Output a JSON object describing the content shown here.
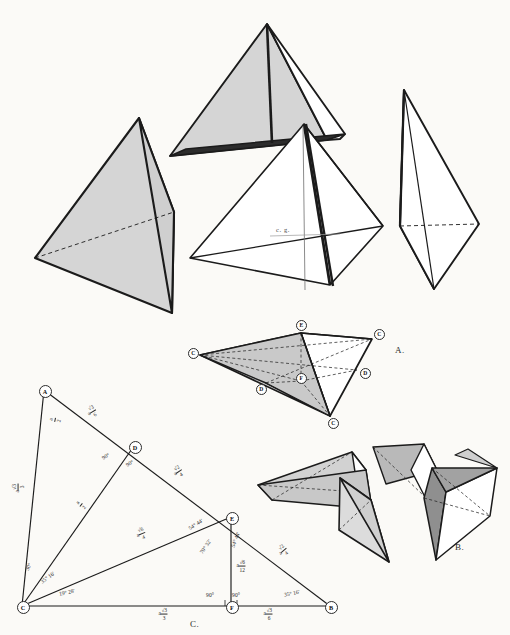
{
  "plate": {
    "title": "Geometric plate: regular tetrahedron dissection and characteristic triangle",
    "background": "#fbfaf7",
    "ink": "#1b1b1b",
    "fill_light": "#d8d8d8",
    "fill_mid": "#b5b5b5",
    "fill_dark": "#3a3a3a"
  },
  "figure_labels": {
    "a": "A.",
    "b": "B.",
    "c": "C."
  },
  "annotations": {
    "center_of_gravity": "c. g."
  },
  "figure_a_nodes": [
    {
      "id": "E",
      "label": "E",
      "x": 301,
      "y": 325
    },
    {
      "id": "C1",
      "label": "C",
      "x": 193,
      "y": 353
    },
    {
      "id": "C2",
      "label": "C",
      "x": 379,
      "y": 334
    },
    {
      "id": "C3",
      "label": "C",
      "x": 333,
      "y": 423
    },
    {
      "id": "D1",
      "label": "D",
      "x": 261,
      "y": 389
    },
    {
      "id": "D2",
      "label": "D",
      "x": 365,
      "y": 373
    },
    {
      "id": "F",
      "label": "F",
      "x": 301,
      "y": 378
    }
  ],
  "triangle_c": {
    "vertices": [
      {
        "id": "A",
        "label": "A",
        "x": 44,
        "y": 390
      },
      {
        "id": "D",
        "label": "D",
        "x": 134,
        "y": 446
      },
      {
        "id": "E",
        "label": "E",
        "x": 231,
        "y": 517
      },
      {
        "id": "B",
        "label": "B",
        "x": 330,
        "y": 606
      },
      {
        "id": "C",
        "label": "C",
        "x": 22,
        "y": 606
      },
      {
        "id": "F",
        "label": "F",
        "x": 231,
        "y": 606
      }
    ],
    "segment_labels": [
      {
        "name": "AD-upper",
        "pre": "a",
        "num": "√3",
        "den": "6",
        "x": 92,
        "y": 412,
        "rot": -31
      },
      {
        "name": "A-left-a2",
        "pre": "",
        "num": "a",
        "den": "2",
        "x": 55,
        "y": 420,
        "rot": -78
      },
      {
        "name": "AC",
        "pre": "a",
        "num": "√3",
        "den": "3",
        "x": 18,
        "y": 488,
        "rot": -90
      },
      {
        "name": "DE",
        "pre": "a",
        "num": "√2",
        "den": "4",
        "x": 178,
        "y": 472,
        "rot": -34
      },
      {
        "name": "CD",
        "pre": "",
        "num": "a",
        "den": "2",
        "x": 81,
        "y": 505,
        "rot": -52
      },
      {
        "name": "CE",
        "pre": "a",
        "num": "√6",
        "den": "4",
        "x": 141,
        "y": 534,
        "rot": -22
      },
      {
        "name": "EF",
        "pre": "a",
        "num": "√6",
        "den": "12",
        "x": 241,
        "y": 566,
        "rot": 0
      },
      {
        "name": "EB",
        "pre": "a",
        "num": "√2",
        "den": "4",
        "x": 283,
        "y": 551,
        "rot": -41
      },
      {
        "name": "CF",
        "pre": "a",
        "num": "√3",
        "den": "3",
        "x": 163,
        "y": 614,
        "rot": 0
      },
      {
        "name": "FB",
        "pre": "a",
        "num": "√3",
        "den": "6",
        "x": 268,
        "y": 614,
        "rot": 0
      }
    ],
    "angle_labels": [
      {
        "name": "angle-D-upper-left",
        "text": "90°",
        "x": 106,
        "y": 457,
        "rot": -30
      },
      {
        "name": "angle-D-lower-right",
        "text": "90°",
        "x": 130,
        "y": 464,
        "rot": -30
      },
      {
        "name": "angle-C-30",
        "text": "30°",
        "x": 29,
        "y": 567,
        "rot": -66
      },
      {
        "name": "angle-C-3516",
        "text": "35° 16'",
        "x": 48,
        "y": 578,
        "rot": -36
      },
      {
        "name": "angle-C-1928",
        "text": "19° 28'",
        "x": 67,
        "y": 593,
        "rot": -12
      },
      {
        "name": "angle-E-5444-upper",
        "text": "54° 44'",
        "x": 196,
        "y": 525,
        "rot": -32
      },
      {
        "name": "angle-E-7032",
        "text": "70° 32'",
        "x": 206,
        "y": 547,
        "rot": -55
      },
      {
        "name": "angle-E-5444-lower",
        "text": "54° 44'",
        "x": 236,
        "y": 540,
        "rot": -68
      },
      {
        "name": "angle-F-left-90",
        "text": "90°",
        "x": 210,
        "y": 596,
        "rot": 0
      },
      {
        "name": "angle-F-right-90",
        "text": "90°",
        "x": 236,
        "y": 596,
        "rot": 0
      },
      {
        "name": "angle-B-3516",
        "text": "35° 16'",
        "x": 292,
        "y": 594,
        "rot": -12
      }
    ]
  }
}
